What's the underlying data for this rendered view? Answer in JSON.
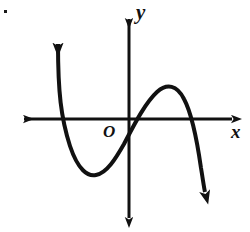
{
  "figure": {
    "kind": "cartesian-graph",
    "background_color": "#ffffff",
    "ink_color": "#111111",
    "width": 250,
    "height": 232,
    "artifact_dot": {
      "name": "page-scan-dot",
      "x": 4,
      "y": 10
    }
  },
  "axes": {
    "x_axis": {
      "label": "x",
      "y_position": 119,
      "x_start": 14,
      "x_end": 241,
      "arrow_left": true,
      "arrow_right": true,
      "label_x": 231,
      "label_y": 122
    },
    "y_axis": {
      "label": "y",
      "x_position": 129,
      "y_start": 8,
      "y_end": 228,
      "arrow_up": true,
      "arrow_down": true,
      "label_x": 136,
      "label_y": 2
    },
    "origin": {
      "label": "O",
      "x": 129,
      "y": 119,
      "label_x": 103,
      "label_y": 123
    }
  },
  "chart_data": {
    "type": "line",
    "title": "",
    "subtitle": "",
    "xlabel": "x",
    "ylabel": "y",
    "legend": [],
    "grid": false,
    "series": [
      {
        "name": "cubic-curve",
        "shape": "negative-leading-coefficient cubic",
        "stroke_color": "#111111",
        "stroke_width": 4,
        "description": "Rises steeply from lower-left branch up to an upward arrow, falls to a local minimum, rises through the origin region to a local maximum, then falls steeply to a downward arrow",
        "x_intercepts": [
          61,
          138,
          196
        ],
        "y_intercept": 134,
        "local_minimum": {
          "x": 93,
          "y": 175
        },
        "local_maximum": {
          "x": 168,
          "y": 87
        },
        "start_arrow": {
          "x": 58,
          "y": 35,
          "direction": "up"
        },
        "end_arrow": {
          "x": 207,
          "y": 200,
          "direction": "down"
        },
        "path": "M 58,44 C 58,92 61,118 70,146 C 78,170 88,177 96,175 C 107,173 116,158 124,144 C 134,125 145,103 157,92 C 167,83 177,85 184,99 C 191,112 197,140 201,168 C 203,180 204,188 205,192"
      }
    ],
    "axis_arrows": {
      "x_left": true,
      "x_right": true,
      "y_up": true,
      "y_down": true
    }
  }
}
